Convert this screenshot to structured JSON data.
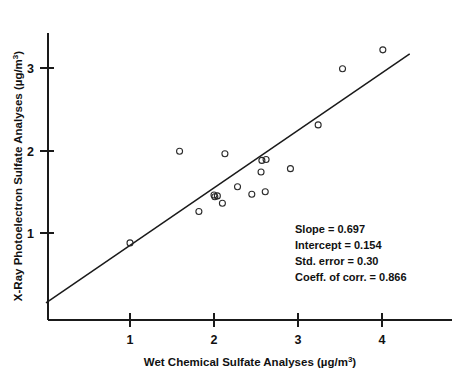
{
  "chart_data": {
    "type": "scatter",
    "title": "",
    "xlabel": "Wet Chemical Sulfate Analyses (µg/m³)",
    "ylabel": "X-Ray Photoelectron Sulfate Analyses (µg/m³)",
    "xlim": [
      0.0,
      4.4
    ],
    "ylim": [
      0.0,
      3.45
    ],
    "xticks": [
      1,
      2,
      3,
      4
    ],
    "xticklabels": [
      "1",
      "2",
      "3",
      "4"
    ],
    "yticks": [
      1,
      2,
      3
    ],
    "yticklabels": [
      "1",
      "2",
      "3"
    ],
    "grid": false,
    "legend": null,
    "marker": "open-circle",
    "series": [
      {
        "name": "Sulfate sample pairs",
        "x": [
          1.0,
          1.59,
          1.82,
          2.0,
          2.01,
          2.1,
          2.13,
          2.28,
          2.45,
          2.56,
          2.57,
          2.61,
          2.62,
          2.91,
          3.24,
          3.53,
          4.01,
          2.04
        ],
        "y": [
          0.88,
          1.99,
          1.26,
          1.46,
          1.44,
          1.36,
          1.96,
          1.56,
          1.47,
          1.74,
          1.88,
          1.5,
          1.89,
          1.78,
          2.31,
          2.99,
          3.22,
          1.45
        ]
      }
    ],
    "fit_line": {
      "name": "least-squares fit",
      "slope": 0.697,
      "intercept": 0.154,
      "x_start": 0.0,
      "x_end": 4.33,
      "y_start": 0.154,
      "y_end": 3.17
    },
    "annotations": {
      "slope": "Slope = 0.697",
      "intercept": "Intercept = 0.154",
      "std_error": "Std. error = 0.30",
      "coeff_corr": "Coeff. of corr. = 0.866"
    }
  },
  "axes": {
    "x_title_main": "Wet Chemical Sulfate Analyses (µg/m",
    "x_title_sup": "3",
    "x_title_tail": ")",
    "y_title_main": "X-Ray Photoelectron Sulfate Analyses (µg/m",
    "y_title_sup": "3",
    "y_title_tail": ")"
  },
  "ticks": {
    "x": [
      "1",
      "2",
      "3",
      "4"
    ],
    "y": [
      "1",
      "2",
      "3"
    ]
  },
  "stats": {
    "line1": "Slope = 0.697",
    "line2": "Intercept = 0.154",
    "line3": "Std. error = 0.30",
    "line4": "Coeff. of corr. = 0.866"
  },
  "colors": {
    "ink": "#1a1a1a",
    "background": "#ffffff",
    "marker_stroke": "#2a2a2a"
  }
}
